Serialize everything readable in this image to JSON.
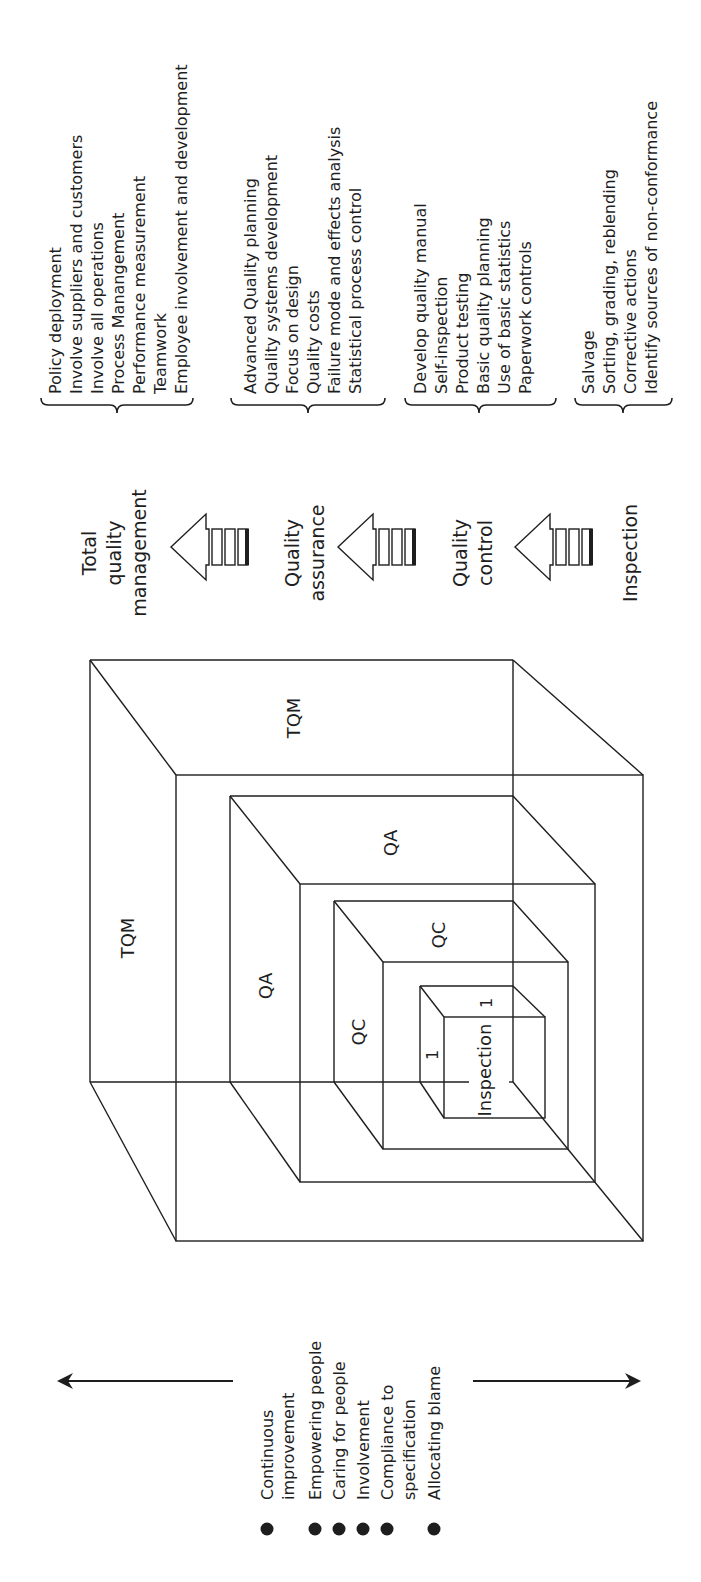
{
  "diagram": {
    "colors": {
      "ink": "#1e1e1e",
      "background": "#ffffff"
    },
    "stages": [
      {
        "key": "tqm",
        "label_lines": [
          "Total",
          "quality",
          "management"
        ],
        "abbrev": "TQM",
        "activities": [
          "Policy deployment",
          "Involve suppliers and customers",
          "Involve all operations",
          "Process Manangement",
          "Performance measurement",
          "Teamwork",
          "Employee involvement and development"
        ]
      },
      {
        "key": "qa",
        "label_lines": [
          "Quality",
          "assurance"
        ],
        "abbrev": "QA",
        "activities": [
          "Advanced Quality planning",
          "Quality systems development",
          "Focus on design",
          "Quality costs",
          "Failure mode and effects analysis",
          "Statistical process control"
        ]
      },
      {
        "key": "qc",
        "label_lines": [
          "Quality",
          "control"
        ],
        "abbrev": "QC",
        "activities": [
          "Develop quality manual",
          "Self-inspection",
          "Product testing",
          "Basic quality planning",
          "Use of basic statistics",
          "Paperwork controls"
        ]
      },
      {
        "key": "inspection",
        "label_lines": [
          "Inspection"
        ],
        "abbrev": "Inspection",
        "activities": [
          "Salvage",
          "Sorting, grading, reblending",
          "Corrective actions",
          "Identify sources of non-conformance"
        ]
      }
    ],
    "cube_labels": {
      "tqm_top": "TQM",
      "tqm_side": "TQM",
      "qa_top": "QA",
      "qa_side": "QA",
      "qc_top": "QC",
      "qc_side": "QC",
      "inspection_front": "Inspection",
      "inspection_dim_top": "1",
      "inspection_dim_side": "1"
    },
    "culture_spectrum": {
      "items": [
        [
          "Continuous",
          "improvement"
        ],
        [
          "Empowering people"
        ],
        [
          "Caring for people"
        ],
        [
          "Involvement"
        ],
        [
          "Compliance to",
          "specification"
        ],
        [
          "Allocating blame"
        ]
      ]
    },
    "icons": {
      "stage_arrow": "progress-arrow-icon",
      "spectrum_left": "arrow-left-icon",
      "spectrum_right": "arrow-right-icon",
      "bullet": "bullet-dot-icon",
      "brace": "curly-brace-icon"
    }
  }
}
